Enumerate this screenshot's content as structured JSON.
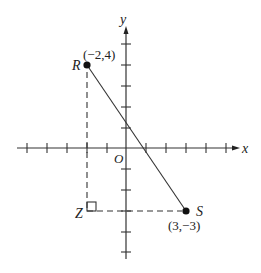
{
  "diagram": {
    "type": "coordinate-plane",
    "axes": {
      "x_label": "x",
      "y_label": "y",
      "origin_label": "O",
      "x_ticks": [
        -5,
        -4,
        -3,
        -2,
        -1,
        1,
        2,
        3,
        4,
        5
      ],
      "y_ticks": [
        -5,
        -4,
        -3,
        -2,
        -1,
        1,
        2,
        3,
        4,
        5
      ]
    },
    "points": [
      {
        "name": "R",
        "coords": "(−2,4)",
        "x": -2,
        "y": 4
      },
      {
        "name": "S",
        "coords": "(3,−3)",
        "x": 3,
        "y": -3
      },
      {
        "name": "Z",
        "x": -2,
        "y": -3
      }
    ],
    "segments": [
      {
        "from": "R",
        "to": "S",
        "style": "solid"
      },
      {
        "from": "R",
        "to": "Z",
        "style": "dashed"
      },
      {
        "from": "Z",
        "to": "S",
        "style": "dashed"
      }
    ],
    "right_angle_at": "Z",
    "colors": {
      "ink": "#222222",
      "background": "#ffffff"
    }
  }
}
